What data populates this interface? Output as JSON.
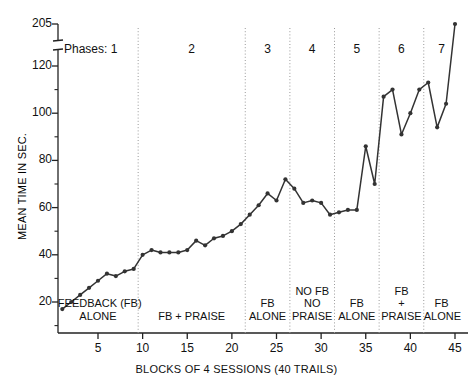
{
  "chart_data": {
    "type": "line",
    "title": "",
    "xlabel": "BLOCKS OF 4 SESSIONS (40 TRAILS)",
    "ylabel": "MEAN TIME IN SEC.",
    "phases_prefix": "Phases: 1",
    "x": [
      1,
      2,
      3,
      4,
      5,
      6,
      7,
      8,
      9,
      10,
      11,
      12,
      13,
      14,
      15,
      16,
      17,
      18,
      19,
      20,
      21,
      22,
      23,
      24,
      25,
      26,
      27,
      28,
      29,
      30,
      31,
      32,
      33,
      34,
      35,
      36,
      37,
      38,
      39,
      40,
      41,
      42,
      43,
      44,
      45
    ],
    "values": [
      17,
      20,
      23,
      26,
      29,
      32,
      31,
      33,
      34,
      40,
      42,
      41,
      41,
      41,
      42,
      46,
      44,
      47,
      48,
      50,
      53,
      57,
      61,
      66,
      63,
      72,
      68,
      62,
      63,
      62,
      57,
      58,
      59,
      59,
      86,
      70,
      107,
      110,
      91,
      100,
      110,
      113,
      94,
      104,
      205
    ],
    "ylim": [
      10,
      205
    ],
    "yticks": [
      20,
      40,
      60,
      80,
      100,
      120,
      205
    ],
    "y_minor_step": 10,
    "axis_break_between": [
      120,
      205
    ],
    "xticks": [
      5,
      10,
      15,
      20,
      25,
      30,
      35,
      40,
      45
    ],
    "xlim": [
      0.5,
      45.8
    ],
    "grid": false,
    "legend": "none",
    "marker": "filled-circle",
    "line_color": "#333333",
    "phases": [
      {
        "number": "1",
        "label_lines": [
          "FEEDBACK (FB)",
          "ALONE"
        ],
        "start": 1,
        "end": 9
      },
      {
        "number": "2",
        "label_lines": [
          "FB + PRAISE"
        ],
        "start": 10,
        "end": 21
      },
      {
        "number": "3",
        "label_lines": [
          "FB",
          "ALONE"
        ],
        "start": 22,
        "end": 26
      },
      {
        "number": "4",
        "label_lines": [
          "NO FB",
          "NO",
          "PRAISE"
        ],
        "start": 27,
        "end": 31
      },
      {
        "number": "5",
        "label_lines": [
          "FB",
          "ALONE"
        ],
        "start": 32,
        "end": 36
      },
      {
        "number": "6",
        "label_lines": [
          "FB",
          "+",
          "PRAISE"
        ],
        "start": 37,
        "end": 41
      },
      {
        "number": "7",
        "label_lines": [
          "FB",
          "ALONE"
        ],
        "start": 42,
        "end": 45
      }
    ]
  }
}
